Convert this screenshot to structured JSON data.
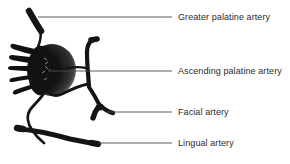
{
  "figure": {
    "name": "palatine-arteries-diagram",
    "background_color": "#ffffff",
    "vessel_color": "#141414",
    "mass_color": "#1a1a1a",
    "mass_rim_color": "#6e6e6e",
    "leader_color": "#4a4a4a",
    "text_color": "#2b2b2b"
  },
  "labels": [
    {
      "id": "greater-palatine-artery",
      "text": "Greater palatine artery",
      "leader": {
        "x1": 38,
        "y1": 17,
        "x2": 172,
        "y2": 17
      }
    },
    {
      "id": "ascending-palatine-artery",
      "text": "Ascending palatine artery",
      "leader": {
        "x1": 48,
        "y1": 71,
        "x2": 172,
        "y2": 71
      }
    },
    {
      "id": "facial-artery",
      "text": "Facial artery",
      "leader": {
        "x1": 106,
        "y1": 112,
        "x2": 172,
        "y2": 112
      }
    },
    {
      "id": "lingual-artery",
      "text": "Lingual artery",
      "leader": {
        "x1": 98,
        "y1": 143,
        "x2": 172,
        "y2": 143
      }
    }
  ],
  "structures": [
    {
      "id": "tonsil-mass",
      "kind": "oval-with-projections",
      "projections": 5
    },
    {
      "id": "greater-palatine-vessel",
      "kind": "vessel-stub"
    },
    {
      "id": "ascending-palatine-vessel",
      "kind": "vessel-vertical"
    },
    {
      "id": "facial-vessel",
      "kind": "vessel-branch"
    },
    {
      "id": "lingual-vessel",
      "kind": "vessel-horizontal"
    },
    {
      "id": "descending-vessel",
      "kind": "vessel-curve"
    }
  ]
}
